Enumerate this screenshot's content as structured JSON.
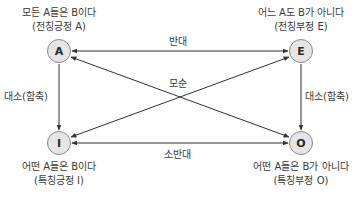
{
  "diagram": {
    "nodes": {
      "A": {
        "letter": "A",
        "statement": "모든 A들은 B이다",
        "name": "(전칭긍정 A)"
      },
      "E": {
        "letter": "E",
        "statement": "어느 A도 B가 아니다",
        "name": "(전칭부정 E)"
      },
      "I": {
        "letter": "I",
        "statement": "어떤 A들은 B이다",
        "name": "(특칭긍정 I)"
      },
      "O": {
        "letter": "O",
        "statement": "어떤 A들은 B가 아니다",
        "name": "(특칭부정 O)"
      }
    },
    "edges": {
      "contrary": "반대",
      "contradiction": "모순",
      "subcontrary": "소반대",
      "subalternation_left": "대소(함축)",
      "subalternation_right": "대소(함축)"
    },
    "colors": {
      "line": "#333333",
      "node_fill": "#e6e6e6",
      "node_border": "#8a8a8a",
      "text": "#3a3a3a"
    }
  }
}
